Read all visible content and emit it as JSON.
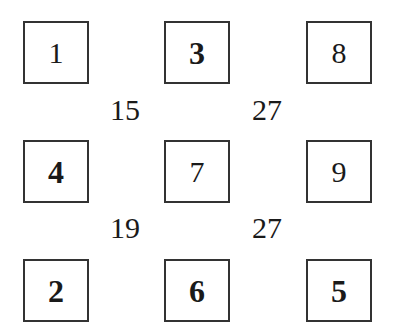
{
  "grid": {
    "cells": [
      {
        "value": "1",
        "bold": false
      },
      {
        "value": "3",
        "bold": true
      },
      {
        "value": "8",
        "bold": false
      },
      {
        "value": "4",
        "bold": true
      },
      {
        "value": "7",
        "bold": false
      },
      {
        "value": "9",
        "bold": false
      },
      {
        "value": "2",
        "bold": true
      },
      {
        "value": "6",
        "bold": true
      },
      {
        "value": "5",
        "bold": true
      }
    ],
    "sums": [
      {
        "value": "15",
        "position": "between cells 1,3,4,7"
      },
      {
        "value": "27",
        "position": "between cells 3,8,7,9"
      },
      {
        "value": "19",
        "position": "between cells 4,7,2,6"
      },
      {
        "value": "27",
        "position": "between cells 7,9,6,5"
      }
    ]
  }
}
